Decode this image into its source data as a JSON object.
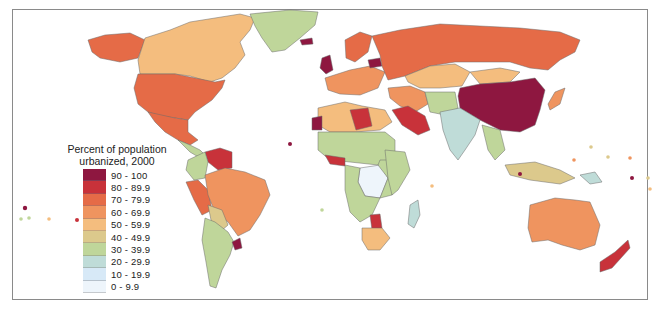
{
  "legend": {
    "title_line1": "Percent of population",
    "title_line2": "urbanized, 2000",
    "classes": [
      {
        "label": "90 - 100",
        "color": "#8e1740"
      },
      {
        "label": "80 - 89.9",
        "color": "#c8323a"
      },
      {
        "label": "70 - 79.9",
        "color": "#e56b47"
      },
      {
        "label": "60 - 69.9",
        "color": "#ef945f"
      },
      {
        "label": "50 - 59.9",
        "color": "#f4bd7e"
      },
      {
        "label": "40 - 49.9",
        "color": "#dcc98c"
      },
      {
        "label": "30 - 39.9",
        "color": "#bfd69a"
      },
      {
        "label": "20 - 29.9",
        "color": "#bfdcd8"
      },
      {
        "label": "10 - 19.9",
        "color": "#d7e9f7"
      },
      {
        "label": "0 - 9.9",
        "color": "#eef5fb"
      }
    ]
  },
  "map": {
    "regions": {
      "usa": "70 - 79.9",
      "canada": "50 - 59.9",
      "alaska": "70 - 79.9",
      "greenland": "30 - 39.9",
      "mexico": "70 - 79.9",
      "brazil": "60 - 69.9",
      "venezuela": "80 - 89.9",
      "argentina_chile": "30 - 39.9",
      "uruguay": "90 - 100",
      "russia": "70 - 79.9",
      "china": "90 - 100",
      "india": "20 - 29.9",
      "australia": "60 - 69.9",
      "new_zealand": "80 - 89.9",
      "libya": "80 - 89.9",
      "saudi_arabia": "80 - 89.9",
      "drc": "0 - 9.9",
      "botswana": "80 - 89.9",
      "south_africa": "50 - 59.9",
      "iceland": "90 - 100",
      "belarus": "90 - 100",
      "mongolia_kazakhstan": "50 - 59.9",
      "japan": "60 - 69.9",
      "madagascar": "20 - 29.9"
    }
  }
}
